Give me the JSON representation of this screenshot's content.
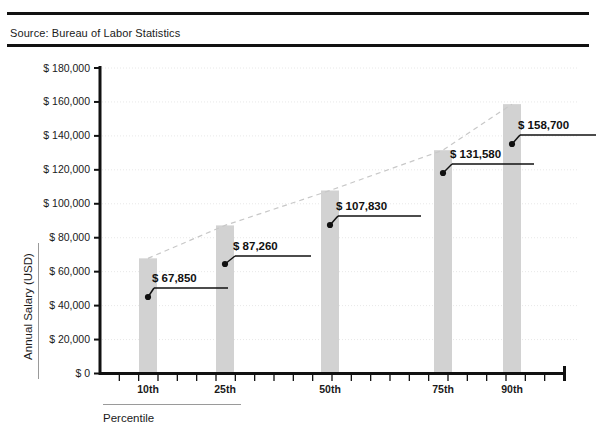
{
  "header": {
    "source_text": "Source: Bureau of Labor Statistics"
  },
  "chart_data": {
    "type": "bar",
    "title": "",
    "subtitle": "",
    "xlabel": "Percentile",
    "ylabel": "Annual Salary (USD)",
    "categories": [
      "10th",
      "25th",
      "50th",
      "75th",
      "90th"
    ],
    "values": [
      67850,
      87260,
      107830,
      131580,
      158700
    ],
    "value_labels": [
      "$ 67,850",
      "$ 87,260",
      "$ 107,830",
      "$ 131,580",
      "$ 158,700"
    ],
    "ylim": [
      0,
      180000
    ],
    "ytick_values": [
      0,
      20000,
      40000,
      60000,
      80000,
      100000,
      120000,
      140000,
      160000,
      180000
    ],
    "ytick_labels": [
      "$ 0",
      "$ 20,000",
      "$ 40,000",
      "$ 60,000",
      "$ 80,000",
      "$ 100,000",
      "$ 120,000",
      "$ 140,000",
      "$ 160,000",
      "$ 180,000"
    ],
    "grid": "horizontal-dotted",
    "legend": "none",
    "series": [
      {
        "name": "Annual Salary (USD)",
        "values": [
          67850,
          87260,
          107830,
          131580,
          158700
        ]
      },
      {
        "name": "trend",
        "style": "dashed-line",
        "values": [
          67850,
          87260,
          107830,
          131580,
          158700
        ]
      }
    ],
    "colors": {
      "bar_fill": "#d2d2d2",
      "trend_line": "#c8c8c8",
      "axis": "#111111",
      "gridline": "#e8e8e8",
      "callout": "#111111"
    }
  }
}
